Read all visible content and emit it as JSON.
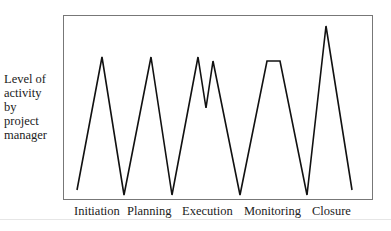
{
  "chart_data": {
    "type": "line",
    "title": "",
    "ylabel": "Level of activity by project manager",
    "ylabel_lines": [
      "Level of",
      "activity",
      "by",
      "project",
      "manager"
    ],
    "xlabel": "",
    "categories": [
      "Initiation",
      "Planning",
      "Execution",
      "Monitoring",
      "Closure"
    ],
    "grid": false,
    "legend": null,
    "axis_ticks": false,
    "series": [
      {
        "name": "Level of activity",
        "color": "#111111",
        "points_px": [
          [
            77,
            190
          ],
          [
            102,
            57
          ],
          [
            124,
            195
          ],
          [
            151,
            57
          ],
          [
            172,
            195
          ],
          [
            198,
            57
          ],
          [
            206,
            108
          ],
          [
            213,
            61
          ],
          [
            240,
            195
          ],
          [
            267,
            61
          ],
          [
            280,
            61
          ],
          [
            307,
            195
          ],
          [
            326,
            26
          ],
          [
            352,
            190
          ]
        ],
        "relative_values": [
          0.05,
          0.78,
          0.0,
          0.78,
          0.0,
          0.78,
          0.5,
          0.75,
          0.0,
          0.75,
          0.75,
          0.0,
          0.95,
          0.05
        ]
      }
    ],
    "phase_peaks": {
      "Initiation": "single peak",
      "Planning": "single peak",
      "Execution": "double peak with dip",
      "Monitoring": "flat plateau",
      "Closure": "highest single peak"
    }
  },
  "labels": {
    "x": [
      {
        "text": "Initiation",
        "left": 74
      },
      {
        "text": "Planning",
        "left": 127
      },
      {
        "text": "Execution",
        "left": 182
      },
      {
        "text": "Monitoring",
        "left": 244
      },
      {
        "text": "Closure",
        "left": 312
      }
    ]
  }
}
